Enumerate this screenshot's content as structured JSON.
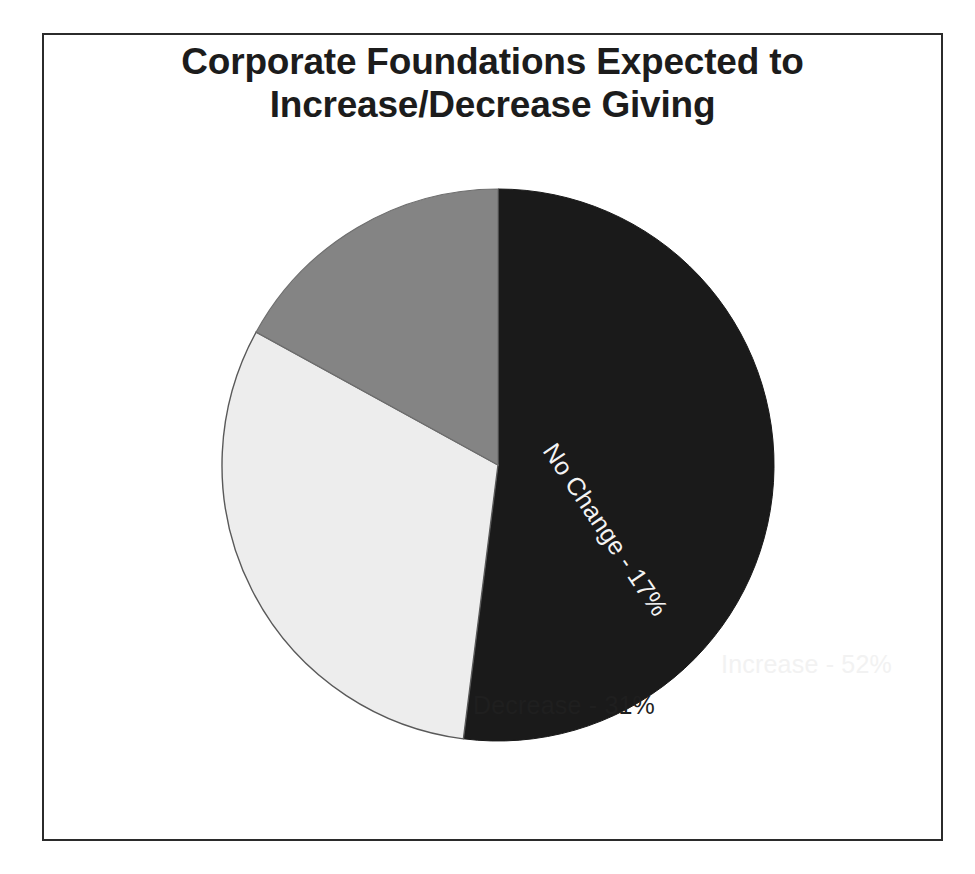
{
  "slide": {
    "background_color": "#ffffff",
    "frame_color": "#2b2b2b"
  },
  "title": {
    "text": "Corporate Foundations Expected to\nIncrease/Decrease Giving",
    "line1": "Corporate Foundations Expected to",
    "line2": "Increase/Decrease Giving",
    "color": "#1c1c1c"
  },
  "labels": {
    "increase": "Increase - 52%",
    "decrease": "Decrease - 31%",
    "no_change": "No Change - 17%"
  },
  "chart_data": {
    "type": "pie",
    "title": "Corporate Foundations Expected to Increase/Decrease Giving",
    "xlabel": "",
    "ylabel": "",
    "legend_position": "none",
    "grid": false,
    "start_angle_deg": 0,
    "direction": "clockwise",
    "units": "percent",
    "total": 100,
    "categories": [
      "Increase",
      "No Change",
      "Decrease"
    ],
    "values": [
      52,
      17,
      31
    ],
    "slices": [
      {
        "name": "Increase",
        "value": 52,
        "label": "Increase - 52%",
        "color": "#1a1a1a",
        "label_color": "#f2f2f2",
        "start_deg": 0,
        "end_deg": 187.2
      },
      {
        "name": "Decrease",
        "value": 31,
        "label": "Decrease - 31%",
        "color": "#ededed",
        "label_color": "#1f1f1f",
        "start_deg": 187.2,
        "end_deg": 298.8
      },
      {
        "name": "No Change",
        "value": 17,
        "label": "No Change - 17%",
        "color": "#848484",
        "label_color": "#f4f4f4",
        "start_deg": 298.8,
        "end_deg": 360
      }
    ]
  }
}
